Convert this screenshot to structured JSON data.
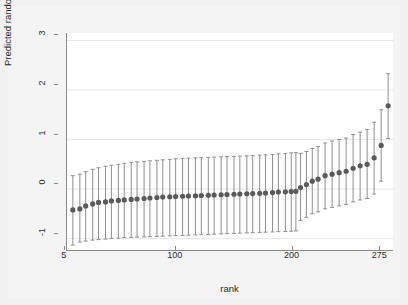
{
  "chart_data": {
    "type": "scatter",
    "title": "",
    "subtitle": "",
    "xlabel": "rank",
    "ylabel": "Predicted random intercept",
    "xlim": [
      0,
      280
    ],
    "ylim": [
      -1.25,
      3.15
    ],
    "xticks": [
      5,
      100,
      200,
      275
    ],
    "xtick_labels": [
      "5",
      "100",
      "200",
      "275"
    ],
    "yticks": [
      -1,
      0,
      1,
      2,
      3
    ],
    "ytick_labels": [
      "-1",
      "0",
      "1",
      "2",
      "3"
    ],
    "grid": "horizontal-gridlines-at-yticks",
    "legend": "none",
    "marker": {
      "shape": "circle",
      "color": "#5a5a5a",
      "size": 4
    },
    "errorbar": {
      "color": "#8f8f8f",
      "cap": true,
      "cap_width": 4
    },
    "series": [
      {
        "name": "Predicted random intercept with 95% CI",
        "x": [
          5,
          11,
          16,
          22,
          27,
          33,
          38,
          44,
          49,
          55,
          60,
          66,
          71,
          77,
          82,
          88,
          93,
          99,
          104,
          110,
          115,
          121,
          126,
          132,
          137,
          143,
          148,
          154,
          159,
          165,
          170,
          176,
          181,
          187,
          192,
          196,
          200,
          205,
          210,
          215,
          221,
          227,
          233,
          239,
          245,
          251,
          257,
          263,
          269,
          275
        ],
        "values": [
          -0.42,
          -0.4,
          -0.34,
          -0.3,
          -0.27,
          -0.26,
          -0.24,
          -0.23,
          -0.22,
          -0.21,
          -0.2,
          -0.19,
          -0.18,
          -0.17,
          -0.16,
          -0.155,
          -0.15,
          -0.145,
          -0.14,
          -0.135,
          -0.13,
          -0.125,
          -0.12,
          -0.115,
          -0.11,
          -0.105,
          -0.1,
          -0.095,
          -0.09,
          -0.085,
          -0.08,
          -0.07,
          -0.06,
          -0.055,
          -0.05,
          -0.045,
          0.03,
          0.09,
          0.16,
          0.2,
          0.27,
          0.3,
          0.33,
          0.36,
          0.42,
          0.47,
          0.5,
          0.63,
          0.88,
          1.68
        ],
        "lower": [
          -1.13,
          -1.07,
          -1.05,
          -1.03,
          -1.02,
          -1.01,
          -1.0,
          -0.99,
          -0.98,
          -0.975,
          -0.97,
          -0.965,
          -0.96,
          -0.955,
          -0.95,
          -0.945,
          -0.94,
          -0.935,
          -0.93,
          -0.925,
          -0.92,
          -0.915,
          -0.91,
          -0.905,
          -0.9,
          -0.895,
          -0.89,
          -0.885,
          -0.88,
          -0.875,
          -0.87,
          -0.865,
          -0.86,
          -0.855,
          -0.85,
          -0.845,
          -0.63,
          -0.57,
          -0.5,
          -0.46,
          -0.4,
          -0.37,
          -0.34,
          -0.31,
          -0.26,
          -0.22,
          -0.19,
          -0.1,
          0.16,
          1.02
        ],
        "upper": [
          0.27,
          0.3,
          0.35,
          0.4,
          0.43,
          0.46,
          0.48,
          0.5,
          0.52,
          0.54,
          0.55,
          0.56,
          0.57,
          0.58,
          0.59,
          0.6,
          0.61,
          0.62,
          0.625,
          0.63,
          0.635,
          0.64,
          0.645,
          0.65,
          0.655,
          0.66,
          0.665,
          0.67,
          0.675,
          0.685,
          0.69,
          0.7,
          0.71,
          0.72,
          0.73,
          0.735,
          0.72,
          0.76,
          0.82,
          0.86,
          0.93,
          0.97,
          1.0,
          1.03,
          1.1,
          1.15,
          1.2,
          1.35,
          1.6,
          2.33
        ]
      }
    ]
  },
  "axis": {
    "y_title": "Predicted random intercept",
    "x_title": "rank"
  },
  "colors": {
    "background": "#f1f1f1",
    "plot_background": "#ffffff",
    "axis_line": "#8a8a8a",
    "gridline": "#e8e8e8",
    "marker": "#5a5a5a",
    "errorbar": "#8f8f8f",
    "text": "#1f1f1f"
  }
}
